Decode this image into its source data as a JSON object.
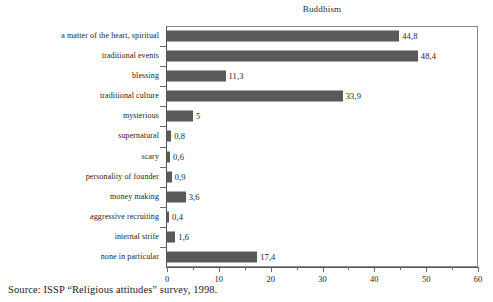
{
  "figure": {
    "source_note": "Source: ISSP “Religious attitudes” survey, 1998."
  },
  "chart_data": {
    "type": "bar",
    "orientation": "horizontal",
    "title": "Buddhism",
    "xlabel": "",
    "ylabel": "",
    "xlim": [
      0,
      60
    ],
    "xticks": [
      0,
      10,
      20,
      30,
      40,
      50,
      60
    ],
    "xtick_labels": [
      "0",
      "10",
      "20",
      "30",
      "40",
      "50",
      "60"
    ],
    "minor_tick_interval": 5,
    "grid": false,
    "legend": false,
    "decimal_separator": ",",
    "bar_color": "#595959",
    "categories": [
      "a matter of the heart, spiritual",
      "traditional events",
      "blessing",
      "traditional culture",
      "mysterious",
      "supernatural",
      "scary",
      "personality of founder",
      "money making",
      "aggressive recruiting",
      "internal strife",
      "none in particular"
    ],
    "values": [
      44.8,
      48.4,
      11.3,
      33.9,
      5,
      0.8,
      0.6,
      0.9,
      3.6,
      0.4,
      1.6,
      17.4
    ],
    "value_labels": [
      "44,8",
      "48,4",
      "11,3",
      "33,9",
      "5",
      "0,8",
      "0,6",
      "0,9",
      "3,6",
      "0,4",
      "1,6",
      "17,4"
    ]
  }
}
